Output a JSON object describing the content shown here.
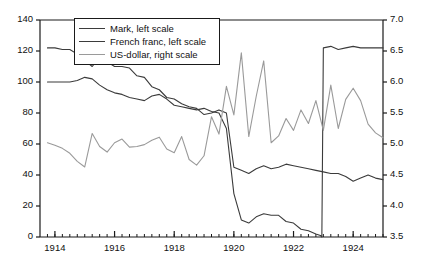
{
  "chart_data": {
    "type": "line",
    "title": "",
    "xlabel": "",
    "ylabel": "",
    "y2label": "",
    "grid": false,
    "legend_position": "top-center-inside",
    "xlim": [
      1913.5,
      1925.0
    ],
    "ylim": [
      0,
      140
    ],
    "y2lim": [
      3.5,
      7.0
    ],
    "x_major_ticks": [
      1914,
      1915,
      1916,
      1917,
      1918,
      1919,
      1920,
      1921,
      1922,
      1923,
      1924,
      1925
    ],
    "x_tick_labels": [
      "1914",
      "1916",
      "1918",
      "1920",
      "1922",
      "1924"
    ],
    "x_tick_label_values": [
      1914,
      1916,
      1918,
      1920,
      1922,
      1924
    ],
    "x_minor_tick_step": 0.25,
    "y_ticks": [
      0,
      20,
      40,
      60,
      80,
      100,
      120,
      140
    ],
    "y_tick_labels": [
      "0",
      "20",
      "40",
      "60",
      "80",
      "100",
      "120",
      "140"
    ],
    "y2_ticks": [
      3.5,
      4.0,
      4.5,
      5.0,
      5.5,
      6.0,
      6.5,
      7.0
    ],
    "y2_tick_labels": [
      "3.5",
      "4.0",
      "4.5",
      "5.0",
      "5.5",
      "6.0",
      "6.5",
      "7.0"
    ],
    "series": [
      {
        "name": "Mark, left scale",
        "axis": "left",
        "color": "#3b3b3b",
        "x": [
          1913.75,
          1914.0,
          1914.25,
          1914.5,
          1914.75,
          1915.0,
          1915.25,
          1915.5,
          1915.75,
          1916.0,
          1916.25,
          1916.5,
          1916.75,
          1917.0,
          1917.25,
          1917.5,
          1917.75,
          1918.0,
          1918.25,
          1918.5,
          1918.75,
          1919.0,
          1919.25,
          1919.5,
          1919.75,
          1920.0,
          1920.25,
          1920.5,
          1920.75,
          1921.0,
          1921.25,
          1921.5,
          1921.75,
          1922.0,
          1922.25,
          1922.5,
          1922.75,
          1922.9,
          1922.95,
          1923.0,
          1923.25,
          1923.5,
          1923.75,
          1924.0,
          1924.25,
          1924.5,
          1924.75,
          1925.0
        ],
        "values": [
          100,
          100,
          100,
          100,
          101,
          103,
          102,
          98,
          95,
          93,
          92,
          90,
          89,
          88,
          91,
          92,
          89,
          85,
          84,
          83,
          82,
          83,
          81,
          80,
          70,
          28,
          11,
          9,
          13,
          15,
          14,
          14,
          10,
          9,
          5,
          4,
          2,
          1,
          0,
          122,
          123,
          121,
          122,
          123,
          122,
          122,
          122,
          122
        ]
      },
      {
        "name": "French franc, left scale",
        "axis": "left",
        "color": "#3b3b3b",
        "x": [
          1913.75,
          1914.0,
          1914.25,
          1914.5,
          1914.75,
          1915.0,
          1915.25,
          1915.5,
          1915.75,
          1916.0,
          1916.25,
          1916.5,
          1916.75,
          1917.0,
          1917.25,
          1917.5,
          1917.75,
          1918.0,
          1918.25,
          1918.5,
          1918.75,
          1919.0,
          1919.25,
          1919.5,
          1919.75,
          1920.0,
          1920.25,
          1920.5,
          1920.75,
          1921.0,
          1921.25,
          1921.5,
          1921.75,
          1922.0,
          1922.25,
          1922.5,
          1922.75,
          1923.0,
          1923.25,
          1923.5,
          1923.75,
          1924.0,
          1924.25,
          1924.5,
          1924.75,
          1925.0
        ],
        "values": [
          122,
          122,
          121,
          121,
          118,
          114,
          110,
          116,
          113,
          110,
          110,
          109,
          104,
          103,
          97,
          95,
          90,
          89,
          86,
          84,
          83,
          79,
          80,
          82,
          80,
          45,
          43,
          41,
          44,
          46,
          44,
          45,
          47,
          46,
          45,
          44,
          43,
          42,
          41,
          41,
          39,
          36,
          38,
          40,
          38,
          37
        ]
      },
      {
        "name": "US-dollar, right scale",
        "axis": "right",
        "color": "#9a9a9a",
        "x": [
          1913.75,
          1914.0,
          1914.25,
          1914.5,
          1914.75,
          1915.0,
          1915.25,
          1915.5,
          1915.75,
          1916.0,
          1916.25,
          1916.5,
          1916.75,
          1917.0,
          1917.25,
          1917.5,
          1917.75,
          1918.0,
          1918.25,
          1918.5,
          1918.75,
          1919.0,
          1919.25,
          1919.5,
          1919.75,
          1920.0,
          1920.25,
          1920.5,
          1920.75,
          1921.0,
          1921.25,
          1921.5,
          1921.75,
          1922.0,
          1922.25,
          1922.5,
          1922.75,
          1923.0,
          1923.25,
          1923.5,
          1923.75,
          1924.0,
          1924.25,
          1924.5,
          1924.75,
          1925.0
        ],
        "values": [
          5.02,
          4.98,
          4.93,
          4.85,
          4.72,
          4.63,
          5.17,
          4.96,
          4.87,
          5.02,
          5.08,
          4.95,
          4.96,
          4.99,
          5.06,
          5.11,
          4.92,
          4.86,
          5.12,
          4.75,
          4.66,
          4.81,
          5.44,
          5.16,
          5.93,
          5.47,
          6.47,
          5.12,
          5.77,
          6.34,
          5.02,
          5.13,
          5.41,
          5.22,
          5.55,
          5.33,
          5.7,
          5.22,
          5.95,
          5.25,
          5.72,
          5.9,
          5.7,
          5.32,
          5.18,
          5.1
        ]
      }
    ]
  },
  "legend": {
    "items": [
      {
        "label": "Mark, left scale",
        "color": "#3b3b3b"
      },
      {
        "label": "French franc, left scale",
        "color": "#3b3b3b"
      },
      {
        "label": "US-dollar, right scale",
        "color": "#9a9a9a"
      }
    ]
  },
  "colors": {
    "axis": "#1a1a1a",
    "text": "#111111",
    "background": "#ffffff"
  }
}
